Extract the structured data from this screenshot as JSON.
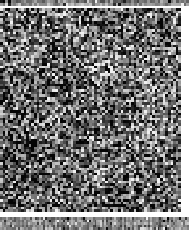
{
  "figure": {
    "kind": "grayscale-heatmap",
    "width": 189,
    "height": 230,
    "background_color": "#ffffff",
    "title": "",
    "caption": "",
    "axis_labels_visible": false,
    "legend_visible": false,
    "tick_labels_visible": false
  },
  "chart_data": {
    "type": "heatmap",
    "title": "",
    "xlabel": "",
    "ylabel": "",
    "grid": false,
    "legend": "none",
    "colormap": "grayscale",
    "color_low": "#050505",
    "color_high": "#f0f0f0",
    "value_range": [
      0,
      1
    ],
    "panels": [
      {
        "name": "top-annotation-strip",
        "role": "column-annotation-bar",
        "x": 0,
        "y": 0,
        "width": 189,
        "height": 6,
        "rows": 2,
        "columns": 72,
        "cell_width_px": 2.625,
        "cell_height_px": 3,
        "mean_value": 0.5,
        "contrast": "low",
        "texture": "coarse-horizontal-banding",
        "seed": 7301
      },
      {
        "name": "main-heatmap-matrix",
        "role": "primary-data-matrix",
        "x": 0,
        "y": 8,
        "width": 181,
        "height": 204,
        "rows": 78,
        "columns": 69,
        "cell_width_px": 2.623,
        "cell_height_px": 2.615,
        "mean_value": 0.42,
        "contrast": "high",
        "texture": "random-speckle-with-light-clusters",
        "seed": 20611,
        "light_clusters": [
          {
            "cx": 0.62,
            "cy": 0.3,
            "rx": 0.13,
            "ry": 0.09,
            "lift": 0.2
          },
          {
            "cx": 0.3,
            "cy": 0.55,
            "rx": 0.1,
            "ry": 0.07,
            "lift": 0.16
          },
          {
            "cx": 0.78,
            "cy": 0.62,
            "rx": 0.12,
            "ry": 0.08,
            "lift": 0.18
          },
          {
            "cx": 0.18,
            "cy": 0.18,
            "rx": 0.09,
            "ry": 0.06,
            "lift": 0.14
          },
          {
            "cx": 0.55,
            "cy": 0.82,
            "rx": 0.11,
            "ry": 0.07,
            "lift": 0.15
          },
          {
            "cx": 0.88,
            "cy": 0.42,
            "rx": 0.08,
            "ry": 0.06,
            "lift": 0.13
          },
          {
            "cx": 0.42,
            "cy": 0.12,
            "rx": 0.08,
            "ry": 0.05,
            "lift": 0.12
          }
        ],
        "dark_clusters": [
          {
            "cx": 0.12,
            "cy": 0.72,
            "rx": 0.1,
            "ry": 0.08,
            "drop": 0.16
          },
          {
            "cx": 0.68,
            "cy": 0.92,
            "rx": 0.12,
            "ry": 0.06,
            "drop": 0.14
          },
          {
            "cx": 0.38,
            "cy": 0.38,
            "rx": 0.08,
            "ry": 0.07,
            "drop": 0.12
          }
        ]
      },
      {
        "name": "bottom-annotation-strip",
        "role": "column-annotation-bar",
        "x": 0,
        "y": 217,
        "width": 189,
        "height": 13,
        "rows": 5,
        "columns": 96,
        "cell_width_px": 1.969,
        "cell_height_px": 2.6,
        "mean_value": 0.55,
        "contrast": "low",
        "texture": "fine-vertical-striping",
        "seed": 4483
      }
    ],
    "gaps": [
      {
        "name": "gap-upper",
        "x": 0,
        "y": 6,
        "width": 189,
        "height": 2,
        "color": "#ffffff"
      },
      {
        "name": "gap-lower",
        "x": 0,
        "y": 212,
        "width": 189,
        "height": 5,
        "color": "#ffffff"
      },
      {
        "name": "right-margin",
        "x": 181,
        "y": 8,
        "width": 8,
        "height": 204,
        "color": "#ffffff"
      }
    ]
  }
}
